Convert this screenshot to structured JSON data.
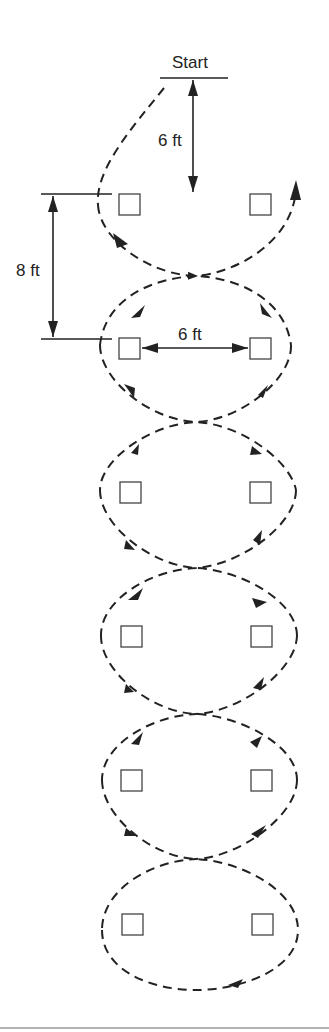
{
  "diagram": {
    "title_label": "Start",
    "dimensions": {
      "start_to_first_row": "6 ft",
      "row_spacing": "8 ft",
      "cone_spacing": "6 ft"
    },
    "cone_rows": 6,
    "cones_per_row": 2,
    "path_style": "dashed figure-eight weave with direction arrows",
    "colors": {
      "line": "#222222",
      "background": "#ffffff",
      "cone_stroke": "#444444"
    }
  }
}
